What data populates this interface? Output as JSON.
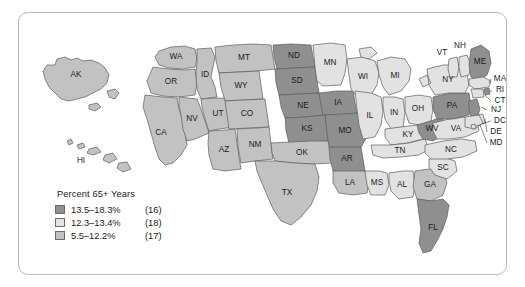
{
  "figure": {
    "type": "choropleth-map",
    "region": "United States",
    "variable": "Percent 65+ Years"
  },
  "legend": {
    "title": "Percent 65+ Years",
    "classes": [
      {
        "range": "13.5–18.3%",
        "count": "(16)",
        "color": "#8f8f8f"
      },
      {
        "range": "12.3–13.4%",
        "count": "(18)",
        "color": "#e2e2e2"
      },
      {
        "range": "5.5–12.2%",
        "count": "(17)",
        "color": "#c2c2c2"
      }
    ]
  },
  "chart_data": {
    "type": "heatmap",
    "title": "Percent 65+ Years",
    "categories": [
      "13.5–18.3%",
      "12.3–13.4%",
      "5.5–12.2%"
    ],
    "values": [
      16,
      18,
      17
    ],
    "legend_position": "bottom-left",
    "grid": false,
    "states": [
      {
        "code": "AK",
        "class": 2
      },
      {
        "code": "HI",
        "class": 2
      },
      {
        "code": "WA",
        "class": 2
      },
      {
        "code": "OR",
        "class": 2
      },
      {
        "code": "CA",
        "class": 2
      },
      {
        "code": "ID",
        "class": 2
      },
      {
        "code": "NV",
        "class": 2
      },
      {
        "code": "UT",
        "class": 2
      },
      {
        "code": "AZ",
        "class": 2
      },
      {
        "code": "MT",
        "class": 2
      },
      {
        "code": "WY",
        "class": 2
      },
      {
        "code": "CO",
        "class": 2
      },
      {
        "code": "NM",
        "class": 2
      },
      {
        "code": "ND",
        "class": 0
      },
      {
        "code": "SD",
        "class": 0
      },
      {
        "code": "NE",
        "class": 0
      },
      {
        "code": "KS",
        "class": 0
      },
      {
        "code": "OK",
        "class": 2
      },
      {
        "code": "TX",
        "class": 2
      },
      {
        "code": "MN",
        "class": 1
      },
      {
        "code": "IA",
        "class": 0
      },
      {
        "code": "MO",
        "class": 0
      },
      {
        "code": "AR",
        "class": 0
      },
      {
        "code": "LA",
        "class": 2
      },
      {
        "code": "WI",
        "class": 1
      },
      {
        "code": "IL",
        "class": 1
      },
      {
        "code": "MS",
        "class": 1
      },
      {
        "code": "MI",
        "class": 1
      },
      {
        "code": "IN",
        "class": 1
      },
      {
        "code": "KY",
        "class": 1
      },
      {
        "code": "TN",
        "class": 1
      },
      {
        "code": "AL",
        "class": 1
      },
      {
        "code": "OH",
        "class": 1
      },
      {
        "code": "WV",
        "class": 0
      },
      {
        "code": "GA",
        "class": 2
      },
      {
        "code": "FL",
        "class": 0
      },
      {
        "code": "SC",
        "class": 1
      },
      {
        "code": "NC",
        "class": 1
      },
      {
        "code": "VA",
        "class": 1
      },
      {
        "code": "PA",
        "class": 0
      },
      {
        "code": "NY",
        "class": 1
      },
      {
        "code": "VT",
        "class": 1
      },
      {
        "code": "NH",
        "class": 1
      },
      {
        "code": "ME",
        "class": 0
      },
      {
        "code": "MA",
        "class": 1
      },
      {
        "code": "RI",
        "class": 0
      },
      {
        "code": "CT",
        "class": 1
      },
      {
        "code": "NJ",
        "class": 0
      },
      {
        "code": "DE",
        "class": 1
      },
      {
        "code": "MD",
        "class": 1
      },
      {
        "code": "DC",
        "class": 1
      }
    ]
  },
  "map_labels": {
    "AK": "AK",
    "HI": "HI",
    "WA": "WA",
    "OR": "OR",
    "CA": "CA",
    "ID": "ID",
    "NV": "NV",
    "UT": "UT",
    "AZ": "AZ",
    "MT": "MT",
    "WY": "WY",
    "CO": "CO",
    "NM": "NM",
    "ND": "ND",
    "SD": "SD",
    "NE": "NE",
    "KS": "KS",
    "OK": "OK",
    "TX": "TX",
    "MN": "MN",
    "IA": "IA",
    "MO": "MO",
    "AR": "AR",
    "LA": "LA",
    "WI": "WI",
    "IL": "IL",
    "MS": "MS",
    "MI": "MI",
    "IN": "IN",
    "KY": "KY",
    "TN": "TN",
    "AL": "AL",
    "OH": "OH",
    "WV": "WV",
    "GA": "GA",
    "FL": "FL",
    "SC": "SC",
    "NC": "NC",
    "VA": "VA",
    "PA": "PA",
    "NY": "NY",
    "VT": "VT",
    "NH": "NH",
    "ME": "ME",
    "MA": "MA",
    "RI": "RI",
    "CT": "CT",
    "NJ": "NJ",
    "DE": "DE",
    "MD": "MD",
    "DC": "DC"
  }
}
